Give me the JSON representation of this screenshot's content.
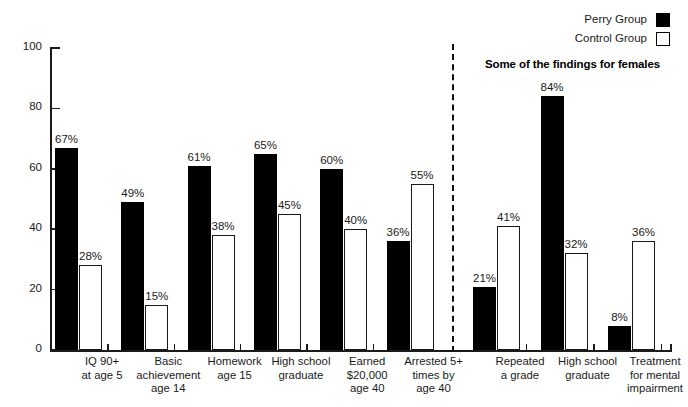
{
  "legend": {
    "items": [
      {
        "label": "Perry Group",
        "swatch": "filled",
        "color": "#000000"
      },
      {
        "label": "Control Group",
        "swatch": "hollow",
        "color": "#ffffff"
      }
    ]
  },
  "section_title": "Some of the findings for females",
  "axis": {
    "y_ticks": [
      "0",
      "20",
      "40",
      "60",
      "80",
      "100"
    ],
    "y_min": 0,
    "y_max": 100
  },
  "chart_data": {
    "type": "bar",
    "title": "",
    "subtitle": "Some of the findings for females",
    "xlabel": "",
    "ylabel": "",
    "ylim": [
      0,
      100
    ],
    "grid": false,
    "legend_position": "top-right",
    "categories": [
      "IQ 90+ at age 5",
      "Basic achievement age 14",
      "Homework age 15",
      "High school graduate",
      "Earned $20,000 age 40",
      "Arrested 5+ times by age 40",
      "Repeated a grade",
      "High school graduate",
      "Treatment for mental impairment"
    ],
    "category_lines": [
      [
        "IQ 90+",
        "at age 5"
      ],
      [
        "Basic",
        "achievement",
        "age 14"
      ],
      [
        "Homework",
        "age 15"
      ],
      [
        "High school",
        "graduate"
      ],
      [
        "Earned",
        "$20,000",
        "age 40"
      ],
      [
        "Arrested 5+",
        "times by",
        "age 40"
      ],
      [
        "Repeated",
        "a grade"
      ],
      [
        "High school",
        "graduate"
      ],
      [
        "Treatment",
        "for mental",
        "impairment"
      ]
    ],
    "series": [
      {
        "name": "Perry Group",
        "color": "#000000",
        "values": [
          67,
          49,
          61,
          65,
          60,
          36,
          21,
          84,
          8
        ],
        "labels": [
          "67%",
          "49%",
          "61%",
          "65%",
          "60%",
          "36%",
          "21%",
          "84%",
          "8%"
        ]
      },
      {
        "name": "Control Group",
        "color": "#ffffff",
        "values": [
          28,
          15,
          38,
          45,
          40,
          55,
          41,
          32,
          36
        ],
        "labels": [
          "28%",
          "15%",
          "38%",
          "45%",
          "40%",
          "55%",
          "41%",
          "32%",
          "36%"
        ]
      }
    ],
    "divider_after_category_index": 5,
    "divider_note": "dashed vertical rule separating male findings (left) from female findings (right)"
  }
}
